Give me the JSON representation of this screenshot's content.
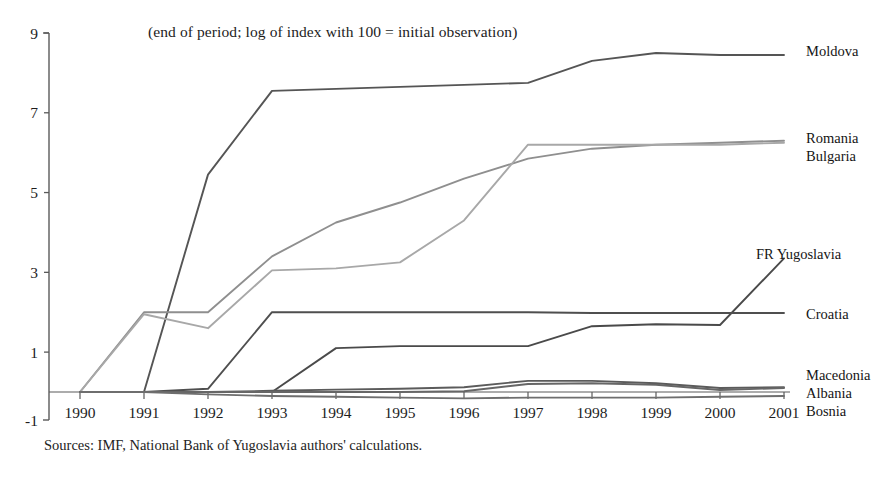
{
  "chart_data": {
    "type": "line",
    "title": "(end of period; log of index with 100 = initial observation)",
    "source_note": "Sources: IMF, National Bank of Yugoslavia authors' calculations.",
    "xlabel": "",
    "ylabel": "",
    "x": [
      1990,
      1991,
      1992,
      1993,
      1994,
      1995,
      1996,
      1997,
      1998,
      1999,
      2000,
      2001
    ],
    "xtick_labels": [
      "1990",
      "1991",
      "1992",
      "1993",
      "1994",
      "1995",
      "1996",
      "1997",
      "1998",
      "1999",
      "2000",
      "2001"
    ],
    "ytick_labels": [
      "9",
      "7",
      "5",
      "3",
      "1",
      "-1"
    ],
    "ytick_values": [
      9,
      7,
      5,
      3,
      1,
      -1
    ],
    "ylim": [
      -1,
      9
    ],
    "xlim": [
      1990,
      2001
    ],
    "grid": false,
    "legend_position": "right-inline-labels",
    "series": [
      {
        "name": "Moldova",
        "color": "#555555",
        "label_x": 806,
        "label_y": 43,
        "values": [
          0.0,
          0.0,
          5.45,
          7.55,
          7.6,
          7.65,
          7.7,
          7.75,
          8.3,
          8.5,
          8.45,
          8.45
        ]
      },
      {
        "name": "Romania",
        "color": "#8f8f8f",
        "label_x": 806,
        "label_y": 130,
        "values": [
          0.0,
          2.0,
          2.0,
          3.4,
          4.25,
          4.75,
          5.35,
          5.85,
          6.1,
          6.2,
          6.25,
          6.3
        ]
      },
      {
        "name": "Bulgaria",
        "color": "#a8a8a8",
        "label_x": 806,
        "label_y": 148,
        "values": [
          0.0,
          1.95,
          1.6,
          3.05,
          3.1,
          3.25,
          4.3,
          6.2,
          6.2,
          6.2,
          6.2,
          6.25
        ]
      },
      {
        "name": "FR Yugoslavia",
        "color": "#4a4a4a",
        "label_x": 756,
        "label_y": 246,
        "values": [
          0.0,
          0.0,
          0.0,
          0.0,
          1.1,
          1.15,
          1.15,
          1.15,
          1.65,
          1.7,
          1.68,
          3.35
        ]
      },
      {
        "name": "Croatia",
        "color": "#4f4f4f",
        "label_x": 806,
        "label_y": 306,
        "values": [
          0.0,
          0.0,
          0.08,
          2.0,
          2.0,
          2.0,
          2.0,
          2.0,
          1.98,
          1.98,
          1.98,
          1.98
        ]
      },
      {
        "name": "Macedonia",
        "color": "#5b5b5b",
        "label_x": 806,
        "label_y": 367,
        "values": [
          0.0,
          0.0,
          0.0,
          0.03,
          0.06,
          0.08,
          0.12,
          0.28,
          0.28,
          0.22,
          0.1,
          0.12
        ]
      },
      {
        "name": "Albania",
        "color": "#666666",
        "label_x": 806,
        "label_y": 385,
        "values": [
          0.0,
          0.0,
          0.0,
          0.0,
          0.0,
          0.0,
          0.02,
          0.2,
          0.22,
          0.18,
          0.05,
          0.1
        ]
      },
      {
        "name": "Bosnia",
        "color": "#6e6e6e",
        "label_x": 806,
        "label_y": 403,
        "values": [
          0.0,
          0.0,
          -0.06,
          -0.1,
          -0.12,
          -0.14,
          -0.16,
          -0.14,
          -0.14,
          -0.14,
          -0.12,
          -0.1
        ]
      }
    ]
  }
}
